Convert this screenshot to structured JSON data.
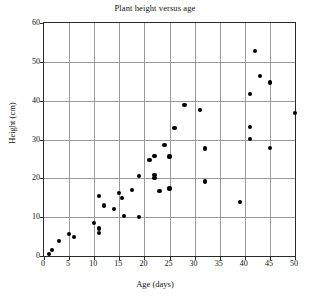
{
  "chart_data": {
    "type": "scatter",
    "title": "Plant height versus age",
    "xlabel": "Age (days)",
    "ylabel": "Height (cm)",
    "xlim": [
      0,
      50
    ],
    "ylim": [
      0,
      60
    ],
    "xticks": [
      0,
      5,
      10,
      15,
      20,
      25,
      30,
      35,
      40,
      45,
      50
    ],
    "yticks": [
      0,
      10,
      20,
      30,
      40,
      50,
      60
    ],
    "grid": true,
    "legend": null,
    "marker": "filled-circle",
    "marker_color": "#000000",
    "points": [
      {
        "x": 1,
        "y": 0.6
      },
      {
        "x": 1.6,
        "y": 1.5
      },
      {
        "x": 3,
        "y": 3.8
      },
      {
        "x": 5,
        "y": 5.7
      },
      {
        "x": 6,
        "y": 4.8
      },
      {
        "x": 10,
        "y": 8.5
      },
      {
        "x": 11,
        "y": 7.1
      },
      {
        "x": 11,
        "y": 5.9
      },
      {
        "x": 11,
        "y": 15.4
      },
      {
        "x": 12,
        "y": 13.0
      },
      {
        "x": 14,
        "y": 12.2
      },
      {
        "x": 15,
        "y": 16.2
      },
      {
        "x": 15.5,
        "y": 15.0
      },
      {
        "x": 16,
        "y": 10.2
      },
      {
        "x": 17.5,
        "y": 17.1
      },
      {
        "x": 19,
        "y": 10.0
      },
      {
        "x": 19,
        "y": 20.7
      },
      {
        "x": 21,
        "y": 24.7
      },
      {
        "x": 22,
        "y": 25.8
      },
      {
        "x": 22,
        "y": 20.9
      },
      {
        "x": 22,
        "y": 20.1
      },
      {
        "x": 23,
        "y": 16.8
      },
      {
        "x": 24,
        "y": 28.5
      },
      {
        "x": 25,
        "y": 25.6
      },
      {
        "x": 25,
        "y": 17.4
      },
      {
        "x": 26,
        "y": 33.0
      },
      {
        "x": 28,
        "y": 38.8
      },
      {
        "x": 31,
        "y": 37.7
      },
      {
        "x": 32,
        "y": 27.7
      },
      {
        "x": 32,
        "y": 19.2
      },
      {
        "x": 39,
        "y": 13.9
      },
      {
        "x": 41,
        "y": 41.7
      },
      {
        "x": 41,
        "y": 33.3
      },
      {
        "x": 41,
        "y": 30.2
      },
      {
        "x": 42,
        "y": 52.8
      },
      {
        "x": 43,
        "y": 46.3
      },
      {
        "x": 45,
        "y": 44.7
      },
      {
        "x": 45,
        "y": 27.8
      },
      {
        "x": 50,
        "y": 36.8
      }
    ]
  }
}
